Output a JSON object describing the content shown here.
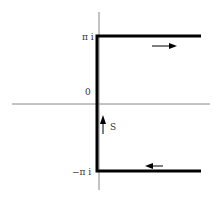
{
  "diagram": {
    "type": "complex-plane contour",
    "labels": {
      "top": "π i",
      "origin": "0",
      "bottom": "−π i",
      "segment": "S"
    },
    "colors": {
      "axis": "#888888",
      "contour": "#000000",
      "text": "#333333"
    }
  }
}
